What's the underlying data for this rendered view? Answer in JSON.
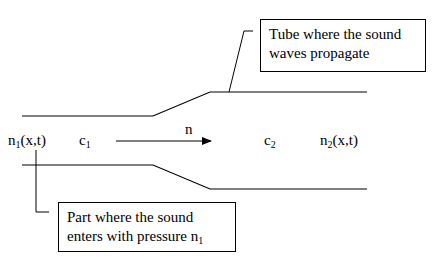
{
  "diagram": {
    "callouts": {
      "tube": {
        "line1": "Tube where the sound",
        "line2": "waves propagate"
      },
      "entry": {
        "line1": "Part where the sound",
        "line2_text": "enters with pressure n",
        "line2_sub": "1"
      }
    },
    "labels": {
      "n1": {
        "base": "n",
        "sub": "1",
        "args": "(x,t)"
      },
      "c1": {
        "base": "c",
        "sub": "1"
      },
      "direction": "n",
      "c2": {
        "base": "c",
        "sub": "2"
      },
      "n2": {
        "base": "n",
        "sub": "2",
        "args": "(x,t)"
      }
    },
    "colors": {
      "line": "#000000",
      "background": "#ffffff"
    }
  }
}
